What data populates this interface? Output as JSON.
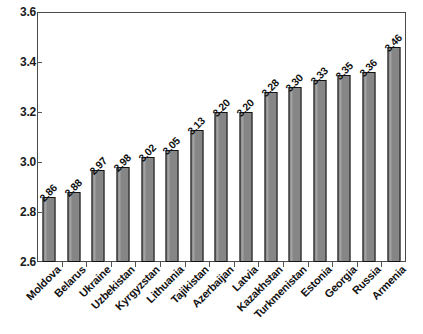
{
  "chart_data": {
    "type": "bar",
    "title": "",
    "subtitle": "",
    "xlabel": "",
    "ylabel": "",
    "ylim": [
      2.6,
      3.6
    ],
    "ytick_labels": [
      "3.6",
      "3.4",
      "3.2",
      "3.0",
      "2.8",
      "2.6"
    ],
    "yticks": [
      3.6,
      3.4,
      3.2,
      3.0,
      2.8,
      2.6
    ],
    "grid": false,
    "legend": null,
    "legend_position": "none",
    "bar_color": "#868686",
    "bar_edge_color": "#111111",
    "axis_color": "#4a4a4a",
    "categories": [
      "Moldova",
      "Belarus",
      "Ukraine",
      "Uzbekistan",
      "Kyrgyzstan",
      "Lithuania",
      "Tajikistan",
      "Azerbaijan",
      "Latvia",
      "Kazakhstan",
      "Turkmenistan",
      "Estonia",
      "Georgia",
      "Russia",
      "Armenia"
    ],
    "values": [
      2.86,
      2.88,
      2.97,
      2.98,
      3.02,
      3.05,
      3.13,
      3.2,
      3.2,
      3.28,
      3.3,
      3.33,
      3.35,
      3.36,
      3.46
    ],
    "value_labels": [
      "2.86",
      "2.88",
      "2.97",
      "2.98",
      "3.02",
      "3.05",
      "3.13",
      "3.20",
      "3.20",
      "3.28",
      "3.30",
      "3.33",
      "3.35",
      "3.36",
      "3.46"
    ]
  }
}
